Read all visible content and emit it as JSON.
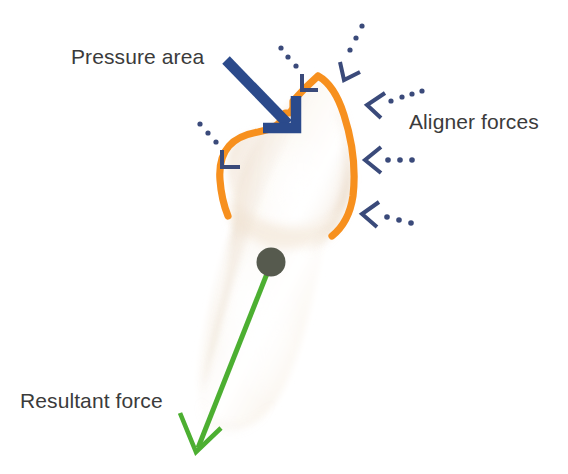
{
  "figure": {
    "kind": "orthodontic-force-diagram",
    "background_color": "#ffffff"
  },
  "labels": {
    "pressure_area": "Pressure area",
    "aligner_forces": "Aligner forces",
    "resultant_force": "Resultant force"
  },
  "colors": {
    "text": "#3b3b3b",
    "pressure_arrow": "#2b4a8b",
    "aligner_arrow": "#3a4a7a",
    "pressure_outline": "#f7901e",
    "resultant_arrow": "#4caf31",
    "center_of_resistance": "#565a4e",
    "tooth_light": "#ffffff",
    "tooth_shadow": "#e8d9c8"
  },
  "annotations": {
    "pressure_area_arrow": {
      "name": "pressure-area-arrow",
      "style": "solid-thick",
      "color": "#2b4a8b",
      "from": [
        228,
        62
      ],
      "to": [
        296,
        133
      ]
    },
    "center_of_resistance": {
      "name": "center-of-resistance-dot",
      "color": "#565a4e",
      "center": [
        271,
        262
      ],
      "radius": 14
    },
    "resultant_force_arrow": {
      "name": "resultant-force-arrow",
      "style": "solid-thin",
      "color": "#4caf31",
      "from": [
        271,
        268
      ],
      "to": [
        196,
        453
      ]
    },
    "pressure_outline": {
      "name": "pressure-area-outline",
      "color": "#f7901e",
      "stroke_width": 7,
      "description": "orange contour tracing the pressure area over the tooth crown"
    },
    "aligner_force_arrows": {
      "name": "aligner-force-arrows",
      "style": "dotted-chevron",
      "color": "#3a4a7a",
      "count": 6,
      "arrows": [
        {
          "id": "arrow-top-left",
          "tip": [
            313,
            83
          ],
          "angle": 135,
          "dots": 3
        },
        {
          "id": "arrow-top-right",
          "tip": [
            351,
            76
          ],
          "angle": 115,
          "dots": 3
        },
        {
          "id": "arrow-right-upper",
          "tip": [
            365,
            98
          ],
          "angle": 148,
          "dots": 4
        },
        {
          "id": "arrow-right-mid",
          "tip": [
            363,
            158
          ],
          "angle": 180,
          "dots": 4
        },
        {
          "id": "arrow-right-lower",
          "tip": [
            362,
            212
          ],
          "angle": 196,
          "dots": 4
        },
        {
          "id": "arrow-left",
          "tip": [
            231,
            164
          ],
          "angle": 315,
          "dots": 3
        }
      ]
    }
  }
}
